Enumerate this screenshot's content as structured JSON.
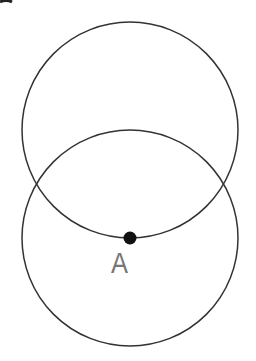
{
  "diagram": {
    "colors": {
      "background": "#ffffff",
      "stroke": "#333333",
      "point": "#111111",
      "label": "#888888"
    },
    "circles": [
      {
        "name": "upper-circle",
        "cx": 130,
        "cy": 130,
        "r": 108
      },
      {
        "name": "lower-circle",
        "cx": 130,
        "cy": 238,
        "r": 108
      }
    ],
    "points": [
      {
        "name": "point-a",
        "label": "A",
        "cx": 130,
        "cy": 238,
        "r": 6
      }
    ]
  }
}
